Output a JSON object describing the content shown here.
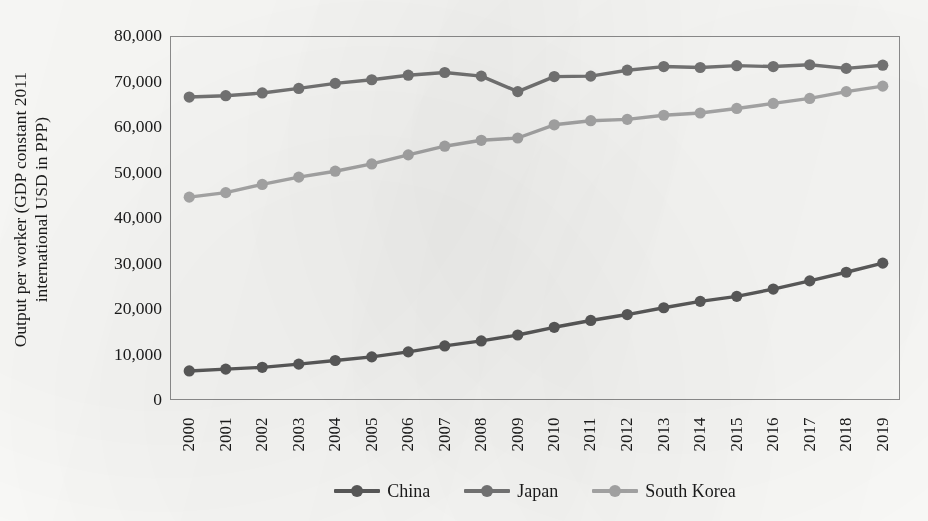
{
  "chart_data": {
    "type": "line",
    "title": "",
    "xlabel": "",
    "ylabel": "Output per worker (GDP constant 2011 international USD in PPP)",
    "ylabel_line1": "Output per worker (GDP constant 2011",
    "ylabel_line2": "international USD in PPP)",
    "ylim": [
      0,
      80000
    ],
    "ytick_step": 10000,
    "grid": false,
    "legend_position": "bottom",
    "categories": [
      "2000",
      "2001",
      "2002",
      "2003",
      "2004",
      "2005",
      "2006",
      "2007",
      "2008",
      "2009",
      "2010",
      "2011",
      "2012",
      "2013",
      "2014",
      "2015",
      "2016",
      "2017",
      "2018",
      "2019"
    ],
    "ytick_labels": [
      "80,000",
      "70,000",
      "60,000",
      "50,000",
      "40,000",
      "30,000",
      "20,000",
      "10,000",
      "0"
    ],
    "ytick_values": [
      80000,
      70000,
      60000,
      50000,
      40000,
      30000,
      20000,
      10000,
      0
    ],
    "series": [
      {
        "name": "China",
        "color": "#5a5a5a",
        "values": [
          6600,
          7000,
          7400,
          8100,
          8900,
          9700,
          10800,
          12100,
          13200,
          14500,
          16200,
          17700,
          19000,
          20500,
          21900,
          23000,
          24600,
          26400,
          28300,
          30300
        ]
      },
      {
        "name": "Japan",
        "color": "#757575",
        "values": [
          66800,
          67100,
          67700,
          68700,
          69800,
          70600,
          71600,
          72200,
          71400,
          68000,
          71300,
          71400,
          72700,
          73500,
          73300,
          73700,
          73500,
          73900,
          73100,
          73800
        ]
      },
      {
        "name": "South Korea",
        "color": "#a8a8a8",
        "values": [
          44800,
          45800,
          47600,
          49200,
          50500,
          52100,
          54100,
          56000,
          57300,
          57800,
          60700,
          61600,
          61900,
          62800,
          63300,
          64300,
          65400,
          66500,
          68000,
          69200
        ]
      }
    ]
  },
  "legend": {
    "items": [
      {
        "label": "China",
        "color": "#5a5a5a"
      },
      {
        "label": "Japan",
        "color": "#757575"
      },
      {
        "label": "South Korea",
        "color": "#a8a8a8"
      }
    ]
  }
}
